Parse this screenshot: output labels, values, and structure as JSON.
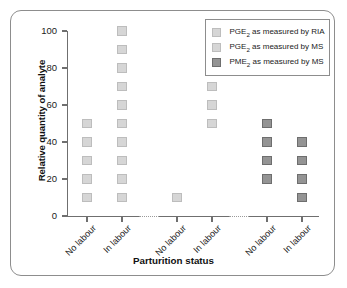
{
  "chart_data": {
    "type": "scatter",
    "title": "",
    "xlabel": "Parturition status",
    "ylabel": "Relative quantity of analyte",
    "ylim": [
      0,
      100
    ],
    "yticks": [
      0,
      20,
      40,
      60,
      80,
      100
    ],
    "grid": false,
    "legend_position": "top-right",
    "categories": [
      "No labour",
      "In labour",
      "No labour",
      "In labour",
      "No labour",
      "In labour"
    ],
    "groups": [
      {
        "series": "PGE2 as measured by RIA",
        "columns": [
          {
            "label": "No labour",
            "values": [
              10,
              20,
              30,
              40,
              50
            ]
          },
          {
            "label": "In labour",
            "values": [
              10,
              20,
              30,
              40,
              50,
              60,
              70,
              80,
              90,
              100
            ]
          }
        ]
      },
      {
        "series": "PGE2 as measured by MS",
        "columns": [
          {
            "label": "No labour",
            "values": [
              10
            ]
          },
          {
            "label": "In labour",
            "values": [
              50,
              60,
              70,
              80,
              90,
              100
            ]
          }
        ]
      },
      {
        "series": "PME2 as measured by MS",
        "columns": [
          {
            "label": "No labour",
            "values": [
              20,
              30,
              40,
              50
            ]
          },
          {
            "label": "In labour",
            "values": [
              10,
              20,
              30,
              40
            ]
          }
        ]
      }
    ],
    "series": [
      {
        "name": "PGE2 as measured by RIA",
        "color": "#d6d6d6",
        "border_color": "#bdbdbd",
        "points": [
          {
            "x": "No labour",
            "y": 10
          },
          {
            "x": "No labour",
            "y": 20
          },
          {
            "x": "No labour",
            "y": 30
          },
          {
            "x": "No labour",
            "y": 40
          },
          {
            "x": "No labour",
            "y": 50
          },
          {
            "x": "In labour",
            "y": 10
          },
          {
            "x": "In labour",
            "y": 20
          },
          {
            "x": "In labour",
            "y": 30
          },
          {
            "x": "In labour",
            "y": 40
          },
          {
            "x": "In labour",
            "y": 50
          },
          {
            "x": "In labour",
            "y": 60
          },
          {
            "x": "In labour",
            "y": 70
          },
          {
            "x": "In labour",
            "y": 80
          },
          {
            "x": "In labour",
            "y": 90
          },
          {
            "x": "In labour",
            "y": 100
          }
        ]
      },
      {
        "name": "PGE2 as measured by MS",
        "color": "#d6d6d6",
        "border_color": "#bdbdbd",
        "points": [
          {
            "x": "No labour",
            "y": 10
          },
          {
            "x": "In labour",
            "y": 50
          },
          {
            "x": "In labour",
            "y": 60
          },
          {
            "x": "In labour",
            "y": 70
          },
          {
            "x": "In labour",
            "y": 80
          },
          {
            "x": "In labour",
            "y": 90
          },
          {
            "x": "In labour",
            "y": 100
          }
        ]
      },
      {
        "name": "PME2 as measured by MS",
        "color": "#949494",
        "border_color": "#6e6e6e",
        "points": [
          {
            "x": "No labour",
            "y": 20
          },
          {
            "x": "No labour",
            "y": 30
          },
          {
            "x": "No labour",
            "y": 40
          },
          {
            "x": "No labour",
            "y": 50
          },
          {
            "x": "In labour",
            "y": 10
          },
          {
            "x": "In labour",
            "y": 20
          },
          {
            "x": "In labour",
            "y": 30
          },
          {
            "x": "In labour",
            "y": 40
          }
        ]
      }
    ]
  },
  "legend": {
    "items": [
      {
        "analyte": "PGE",
        "sub": "2",
        "rest": " as measured by RIA"
      },
      {
        "analyte": "PGE",
        "sub": "2",
        "rest": " as measured by MS"
      },
      {
        "analyte": "PME",
        "sub": "2",
        "rest": " as measured by MS"
      }
    ]
  },
  "axes": {
    "y_title": "Relative quantity of analyte",
    "x_title": "Parturition status",
    "y_tick_labels": [
      "100",
      "80",
      "60",
      "40",
      "20",
      "0"
    ],
    "x_tick_labels": [
      "No labour",
      "In labour",
      "No labour",
      "In labour",
      "No labour",
      "In labour"
    ]
  }
}
